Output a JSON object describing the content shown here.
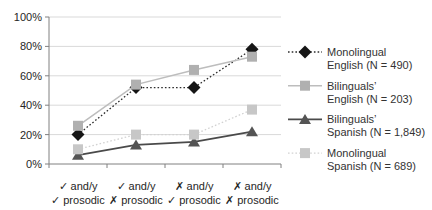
{
  "chart_data": {
    "type": "line",
    "title": "",
    "xlabel": "",
    "ylabel": "",
    "ylim": [
      0,
      100
    ],
    "grid": true,
    "legend_position": "right",
    "y_ticks": [
      "0%",
      "20%",
      "40%",
      "60%",
      "80%",
      "100%"
    ],
    "categories": [
      [
        "✓ and/y",
        "✓ prosodic"
      ],
      [
        "✓ and/y",
        "✗ prosodic"
      ],
      [
        "✗ and/y",
        "✓ prosodic"
      ],
      [
        "✗ and/y",
        "✗ prosodic"
      ]
    ],
    "colors": {
      "grid": "#d9d9d9",
      "axis": "#808080",
      "tick_text": "#262626",
      "legend_text": "#333333",
      "background": "#ffffff"
    },
    "series": [
      {
        "id": "monolingual-english",
        "name": "Monolingual English (N = 490)",
        "legend_lines": [
          "Monolingual",
          "English (N = 490)"
        ],
        "values": [
          20,
          52,
          52,
          78
        ],
        "marker": "diamond",
        "marker_color": "#161616",
        "line_color": "#2e2e2e",
        "line_style": "dotted",
        "line_width": 1.3
      },
      {
        "id": "bilinguals-english",
        "name": "Bilinguals' English (N = 203)",
        "legend_lines": [
          "Bilinguals’",
          "English (N = 203)"
        ],
        "values": [
          26,
          54,
          64,
          73
        ],
        "marker": "square",
        "marker_color": "#b0b0b0",
        "line_color": "#bdbdbd",
        "line_style": "solid",
        "line_width": 1.5
      },
      {
        "id": "bilinguals-spanish",
        "name": "Bilinguals' Spanish (N = 1,849)",
        "legend_lines": [
          "Bilinguals’",
          "Spanish (N = 1,849)"
        ],
        "values": [
          6,
          13,
          15,
          22
        ],
        "marker": "triangle",
        "marker_color": "#545454",
        "line_color": "#4a4a4a",
        "line_style": "solid",
        "line_width": 1.8
      },
      {
        "id": "monolingual-spanish",
        "name": "Monolingual Spanish (N = 689)",
        "legend_lines": [
          "Monolingual",
          "Spanish (N = 689)"
        ],
        "values": [
          10,
          20,
          20,
          37
        ],
        "marker": "square",
        "marker_color": "#c7c7c7",
        "line_color": "#d2d2d2",
        "line_style": "dotted",
        "line_width": 1.3
      }
    ]
  }
}
